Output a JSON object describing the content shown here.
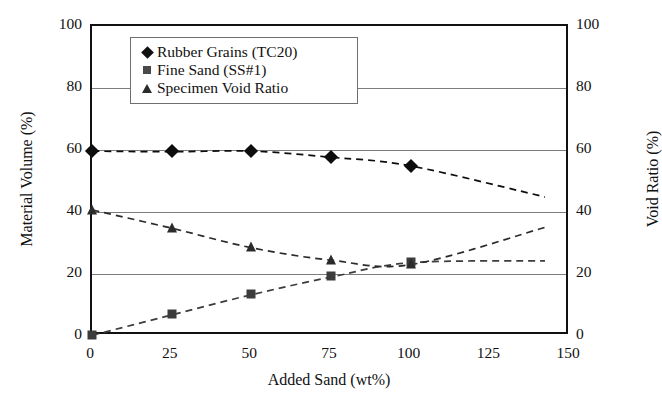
{
  "chart_data": {
    "type": "line",
    "title": "",
    "xlabel": "Added Sand (wt%)",
    "ylabel": "Material Volume (%)",
    "y2label": "Void Ratio (%)",
    "xlim": [
      0,
      150
    ],
    "ylim": [
      0,
      100
    ],
    "y2lim": [
      0,
      100
    ],
    "xticks": [
      0,
      25,
      50,
      75,
      100,
      125,
      150
    ],
    "yticks": [
      0,
      20,
      40,
      60,
      80,
      100
    ],
    "y2ticks": [
      0,
      20,
      40,
      60,
      80,
      100
    ],
    "grid": true,
    "grid_axis": "y",
    "legend_position": "upper-left-inside",
    "series": [
      {
        "name": "Rubber Grains (TC20)",
        "marker": "diamond",
        "linestyle": "dashed",
        "axis": "left",
        "x": [
          0,
          25,
          50,
          75,
          100
        ],
        "values": [
          59.8,
          59.6,
          59.8,
          57.8,
          55.0
        ],
        "trend_end": {
          "x": 142,
          "y": 45.0
        }
      },
      {
        "name": "Fine Sand (SS#1)",
        "marker": "square",
        "linestyle": "dashed",
        "axis": "left",
        "x": [
          0,
          25,
          50,
          75,
          100
        ],
        "values": [
          0.4,
          7.0,
          13.5,
          19.2,
          23.8
        ],
        "trend_end": {
          "x": 142,
          "y": 24.4
        }
      },
      {
        "name": "Specimen Void Ratio",
        "marker": "triangle",
        "linestyle": "dashed",
        "axis": "right",
        "x": [
          0,
          25,
          50,
          75,
          100
        ],
        "values": [
          40.8,
          34.9,
          28.6,
          24.6,
          23.2
        ],
        "trend_end": {
          "x": 142,
          "y": 35.2
        }
      }
    ]
  },
  "legend": {
    "entries": [
      {
        "label": "Rubber Grains (TC20)",
        "marker": "diamond-marker"
      },
      {
        "label": "Fine Sand (SS#1)",
        "marker": "square-marker"
      },
      {
        "label": "Specimen Void Ratio",
        "marker": "triangle-marker"
      }
    ]
  },
  "colors": {
    "frame": "#111111",
    "gridline": "#7d7d7d",
    "series_rubber": "#0d0d0d",
    "series_sand": "#3c3c3c",
    "series_void": "#2b2b2b",
    "background": "#ffffff"
  }
}
